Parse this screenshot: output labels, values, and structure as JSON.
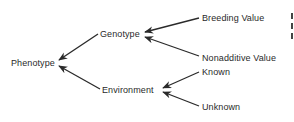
{
  "diagram": {
    "type": "tree",
    "direction": "right-to-left arrows",
    "nodes": [
      {
        "id": "phenotype",
        "label": "Phenotype"
      },
      {
        "id": "genotype",
        "label": "Genotype"
      },
      {
        "id": "environment",
        "label": "Environment"
      },
      {
        "id": "breeding",
        "label": "Breeding Value"
      },
      {
        "id": "nonadditive",
        "label": "Nonadditive Value"
      },
      {
        "id": "known",
        "label": "Known"
      },
      {
        "id": "unknown",
        "label": "Unknown"
      }
    ],
    "edges": [
      {
        "from": "genotype",
        "to": "phenotype"
      },
      {
        "from": "environment",
        "to": "phenotype"
      },
      {
        "from": "breeding",
        "to": "genotype"
      },
      {
        "from": "nonadditive",
        "to": "genotype"
      },
      {
        "from": "known",
        "to": "environment"
      },
      {
        "from": "unknown",
        "to": "environment"
      }
    ],
    "colors": {
      "line": "#2a2a2a",
      "text": "#2a2a2a",
      "background": "#ffffff"
    }
  }
}
